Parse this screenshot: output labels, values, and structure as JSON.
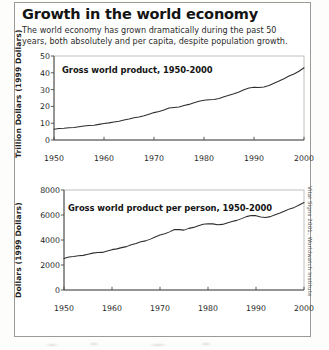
{
  "header": {
    "title": "Growth in the world economy",
    "subtitle": "The world economy has grown dramatically during the past 50 years, both absolutely and per capita, despite population growth."
  },
  "credit": {
    "text": "Vital Signs 2001, Worldwatch Institute"
  },
  "chart_data": [
    {
      "id": "gross-world-product",
      "type": "line",
      "title": "Gross world product, 1950-2000",
      "xlabel": "",
      "ylabel": "Trillion Dollars (1999 Dollars)",
      "xlim": [
        1950,
        2000
      ],
      "ylim": [
        0,
        50
      ],
      "xticks": [
        1950,
        1960,
        1970,
        1980,
        1990,
        2000
      ],
      "xtick_labels": [
        "1950",
        "1960",
        "1970",
        "1980",
        "1990",
        "2000"
      ],
      "yticks": [
        0,
        10,
        20,
        30,
        40,
        50
      ],
      "ytick_labels": [
        "0",
        "10",
        "20",
        "30",
        "40",
        "50"
      ],
      "grid": false,
      "legend": "none",
      "series": [
        {
          "name": "Gross world product",
          "x": [
            1950,
            1951,
            1952,
            1953,
            1954,
            1955,
            1956,
            1957,
            1958,
            1959,
            1960,
            1961,
            1962,
            1963,
            1964,
            1965,
            1966,
            1967,
            1968,
            1969,
            1970,
            1971,
            1972,
            1973,
            1974,
            1975,
            1976,
            1977,
            1978,
            1979,
            1980,
            1981,
            1982,
            1983,
            1984,
            1985,
            1986,
            1987,
            1988,
            1989,
            1990,
            1991,
            1992,
            1993,
            1994,
            1995,
            1996,
            1997,
            1998,
            1999,
            2000
          ],
          "values": [
            6.4,
            6.8,
            7.0,
            7.3,
            7.5,
            7.9,
            8.3,
            8.6,
            8.8,
            9.3,
            9.8,
            10.2,
            10.7,
            11.2,
            11.9,
            12.5,
            13.2,
            13.7,
            14.5,
            15.4,
            16.3,
            17.0,
            17.9,
            19.0,
            19.3,
            19.6,
            20.5,
            21.2,
            22.1,
            23.0,
            23.6,
            24.0,
            24.1,
            24.7,
            25.7,
            26.6,
            27.5,
            28.6,
            29.9,
            30.9,
            31.4,
            31.3,
            31.6,
            32.5,
            33.8,
            35.1,
            36.5,
            38.1,
            39.3,
            40.9,
            43.0
          ]
        }
      ]
    },
    {
      "id": "gross-world-product-per-person",
      "type": "line",
      "title": "Gross world product per person, 1950-2000",
      "xlabel": "",
      "ylabel": "Dollars (1999 Dollars)",
      "xlim": [
        1950,
        2000
      ],
      "ylim": [
        0,
        8000
      ],
      "xticks": [
        1950,
        1960,
        1970,
        1980,
        1990,
        2000
      ],
      "xtick_labels": [
        "1950",
        "1960",
        "1970",
        "1980",
        "1990",
        "2000"
      ],
      "yticks": [
        0,
        2000,
        4000,
        6000,
        8000
      ],
      "ytick_labels": [
        "0",
        "2000",
        "4000",
        "6000",
        "8000"
      ],
      "grid": false,
      "legend": "none",
      "series": [
        {
          "name": "Gross world product per person",
          "x": [
            1950,
            1951,
            1952,
            1953,
            1954,
            1955,
            1956,
            1957,
            1958,
            1959,
            1960,
            1961,
            1962,
            1963,
            1964,
            1965,
            1966,
            1967,
            1968,
            1969,
            1970,
            1971,
            1972,
            1973,
            1974,
            1975,
            1976,
            1977,
            1978,
            1979,
            1980,
            1981,
            1982,
            1983,
            1984,
            1985,
            1986,
            1987,
            1988,
            1989,
            1990,
            1991,
            1992,
            1993,
            1994,
            1995,
            1996,
            1997,
            1998,
            1999,
            2000
          ],
          "values": [
            2520,
            2640,
            2680,
            2740,
            2770,
            2860,
            2950,
            3000,
            3010,
            3120,
            3230,
            3290,
            3390,
            3470,
            3620,
            3730,
            3860,
            3930,
            4070,
            4240,
            4400,
            4500,
            4650,
            4840,
            4830,
            4790,
            4930,
            5010,
            5140,
            5260,
            5300,
            5290,
            5220,
            5250,
            5370,
            5480,
            5570,
            5710,
            5870,
            5960,
            5950,
            5840,
            5800,
            5870,
            6020,
            6160,
            6320,
            6490,
            6610,
            6800,
            7000
          ]
        }
      ]
    }
  ]
}
